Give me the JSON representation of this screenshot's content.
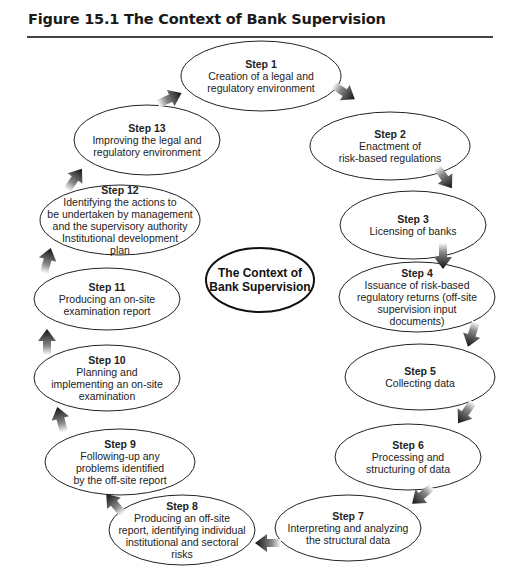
{
  "figure": {
    "title": "Figure 15.1  The Context of Bank Supervision"
  },
  "center": {
    "text": "The Context of\nBank Supervision"
  },
  "steps": [
    {
      "label": "Step 1",
      "text": "Creation of a legal and\nregulatory environment"
    },
    {
      "label": "Step 2",
      "text": "Enactment of\nrisk-based regulations"
    },
    {
      "label": "Step 3",
      "text": "Licensing of banks"
    },
    {
      "label": "Step 4",
      "text": "Issuance of risk-based\nregulatory returns (off-site\nsupervision input\ndocuments)"
    },
    {
      "label": "Step 5",
      "text": "Collecting data"
    },
    {
      "label": "Step 6",
      "text": "Processing and\nstructuring of data"
    },
    {
      "label": "Step 7",
      "text": "Interpreting and analyzing\nthe structural data"
    },
    {
      "label": "Step 8",
      "text": "Producing an off-site\nreport, identifying individual\ninstitutional and sectoral\nrisks"
    },
    {
      "label": "Step 9",
      "text": "Following-up any\nproblems identified\nby the off-site report"
    },
    {
      "label": "Step 10",
      "text": "Planning and\nimplementing an on-site\nexamination"
    },
    {
      "label": "Step 11",
      "text": "Producing an on-site\nexamination report"
    },
    {
      "label": "Step 12",
      "text": "Identifying the actions to\nbe undertaken by management\nand the supervisory authority\nInstitutional development\nplan"
    },
    {
      "label": "Step 13",
      "text": "Improving the legal and\nregulatory environment"
    }
  ],
  "flow": {
    "type": "cycle",
    "direction": "clockwise",
    "order": [
      "Step 1",
      "Step 2",
      "Step 3",
      "Step 4",
      "Step 5",
      "Step 6",
      "Step 7",
      "Step 8",
      "Step 9",
      "Step 10",
      "Step 11",
      "Step 12",
      "Step 13",
      "Step 1"
    ]
  }
}
